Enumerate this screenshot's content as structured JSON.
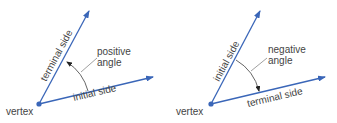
{
  "colors": {
    "ray": "#3a66b8",
    "arc": "#555555",
    "leader": "#888888",
    "text": "#444444"
  },
  "diagrams": [
    {
      "id": "positive",
      "vertex_label": "vertex",
      "terminal_label": "terminal side",
      "initial_label": "initial side",
      "angle_label_line1": "positive",
      "angle_label_line2": "angle"
    },
    {
      "id": "negative",
      "vertex_label": "vertex",
      "initial_label": "initial side",
      "terminal_label": "terminal side",
      "angle_label_line1": "negative",
      "angle_label_line2": "angle"
    }
  ]
}
